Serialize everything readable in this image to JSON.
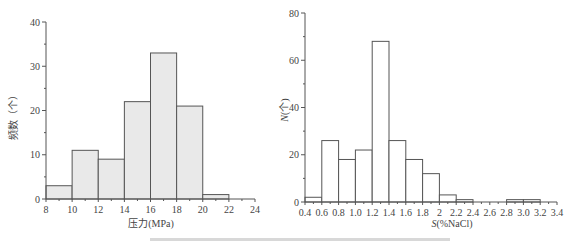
{
  "chart_data": [
    {
      "type": "bar",
      "subtype": "histogram",
      "title": "",
      "xlabel": "压力(MPa)",
      "ylabel": "频数（个）",
      "bin_edges": [
        8,
        10,
        12,
        14,
        16,
        18,
        20,
        22
      ],
      "categories": [
        "8-10",
        "10-12",
        "12-14",
        "14-16",
        "16-18",
        "18-20",
        "20-22"
      ],
      "values": [
        3,
        11,
        9,
        22,
        33,
        21,
        1
      ],
      "xlim": [
        8,
        24
      ],
      "ylim": [
        0,
        40
      ],
      "x_ticks": [
        "8",
        "10",
        "12",
        "14",
        "16",
        "18",
        "20",
        "22",
        "24"
      ],
      "y_ticks": [
        "0",
        "10",
        "20",
        "30",
        "40"
      ],
      "bar_fill": "#e9e9e9",
      "bar_edge": "#555555",
      "grid": false,
      "legend": null
    },
    {
      "type": "bar",
      "subtype": "histogram",
      "title": "",
      "xlabel": "S(%NaCl)",
      "ylabel": "N(个)",
      "bin_edges": [
        0.4,
        0.6,
        0.8,
        1.0,
        1.2,
        1.4,
        1.6,
        1.8,
        2.0,
        2.2,
        2.4,
        2.6,
        2.8,
        3.0,
        3.2
      ],
      "categories": [
        "0.4-0.6",
        "0.6-0.8",
        "0.8-1.0",
        "1.0-1.2",
        "1.2-1.4",
        "1.4-1.6",
        "1.6-1.8",
        "1.8-2.0",
        "2.0-2.2",
        "2.2-2.4",
        "2.4-2.6",
        "2.6-2.8",
        "2.8-3.0",
        "3.0-3.2"
      ],
      "values": [
        2,
        26,
        18,
        22,
        68,
        26,
        18,
        12,
        3,
        1,
        0,
        0,
        1,
        1
      ],
      "xlim": [
        0.4,
        3.4
      ],
      "ylim": [
        0,
        80
      ],
      "x_ticks": [
        "0.4",
        "0.6",
        "0.8",
        "1.0",
        "1.2",
        "1.4",
        "1.6",
        "1.8",
        "2",
        "2.2",
        "2.4",
        "2.6",
        "2.8",
        "3.0",
        "3.2",
        "3.4"
      ],
      "y_ticks": [
        "0",
        "20",
        "40",
        "60",
        "80"
      ],
      "bar_fill": "#ffffff",
      "bar_edge": "#555555",
      "grid": false,
      "legend": null
    }
  ],
  "left": {
    "xlabel": "压力(MPa)",
    "ylabel": "频数（个）"
  },
  "right": {
    "xlabel_italic": "S",
    "xlabel_rest": "(%NaCl)",
    "ylabel_italic": "N",
    "ylabel_rest": "(个)"
  }
}
